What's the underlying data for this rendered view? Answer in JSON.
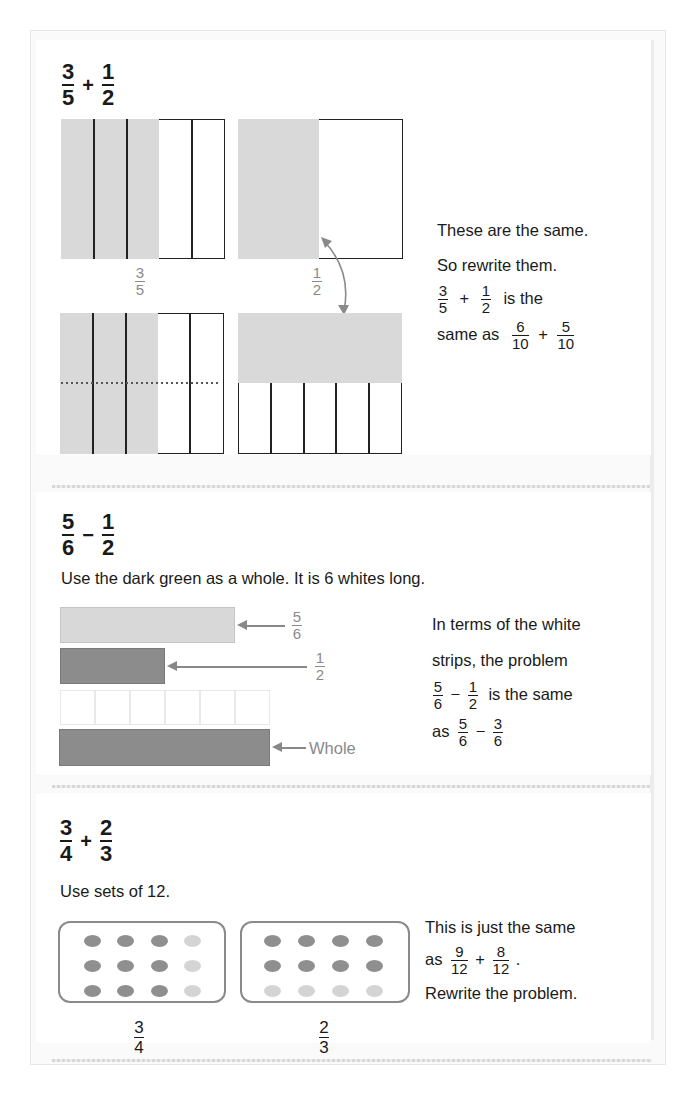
{
  "colors": {
    "shade_light": "#d9d9d9",
    "rod_light": "#d8d8d8",
    "rod_dark": "#8c8c8c",
    "dot_dark": "#8f8f8f",
    "dot_light": "#d4d4d4",
    "label_gray": "#8a8a8a"
  },
  "problem1": {
    "heading": {
      "a_num": "3",
      "a_den": "5",
      "op": "+",
      "b_num": "1",
      "b_den": "2"
    },
    "diagram": {
      "left_label": {
        "num": "3",
        "den": "5"
      },
      "right_label": {
        "num": "1",
        "den": "2"
      },
      "left_columns": 5,
      "left_shaded_columns": 3,
      "right_top_shaded_fraction": "1/2",
      "bottom_right_columns": 5
    },
    "explanation": {
      "line1": "These are the same.",
      "line2": "So rewrite them.",
      "eq1": {
        "a_num": "3",
        "a_den": "5",
        "op": "+",
        "b_num": "1",
        "b_den": "2",
        "suffix": "is the"
      },
      "line4_prefix": "same as",
      "eq2": {
        "a_num": "6",
        "a_den": "10",
        "op": "+",
        "b_num": "5",
        "b_den": "10"
      }
    }
  },
  "problem2": {
    "heading": {
      "a_num": "5",
      "a_den": "6",
      "op": "−",
      "b_num": "1",
      "b_den": "2"
    },
    "instruction": "Use the dark green as a whole. It is 6 whites long.",
    "rods": [
      {
        "name": "five-sixths",
        "label_num": "5",
        "label_den": "6",
        "length_units": 5
      },
      {
        "name": "one-half",
        "label_num": "1",
        "label_den": "2",
        "length_units": 3
      },
      {
        "name": "white-strips",
        "count": 6
      },
      {
        "name": "whole",
        "label": "Whole",
        "length_units": 6
      }
    ],
    "explanation": {
      "line1": "In terms of the white",
      "line2": "strips, the problem",
      "eq1": {
        "a_num": "5",
        "a_den": "6",
        "op": "−",
        "b_num": "1",
        "b_den": "2",
        "suffix": "is the same"
      },
      "line4_prefix": "as",
      "eq2": {
        "a_num": "5",
        "a_den": "6",
        "op": "−",
        "b_num": "3",
        "b_den": "6"
      }
    }
  },
  "problem3": {
    "heading": {
      "a_num": "3",
      "a_den": "4",
      "op": "+",
      "b_num": "2",
      "b_den": "3"
    },
    "instruction": "Use sets of 12.",
    "sets": [
      {
        "label_num": "3",
        "label_den": "4",
        "rows": 3,
        "cols": 4,
        "dark_count": 9,
        "pattern": "first 3 columns dark"
      },
      {
        "label_num": "2",
        "label_den": "3",
        "rows": 3,
        "cols": 4,
        "dark_count": 8,
        "pattern": "first 2 rows dark"
      }
    ],
    "explanation": {
      "line1": "This is just the same",
      "line2_prefix": "as",
      "eq": {
        "a_num": "9",
        "a_den": "12",
        "op": "+",
        "b_num": "8",
        "b_den": "12",
        "suffix": "."
      },
      "line3": "Rewrite the problem."
    }
  }
}
